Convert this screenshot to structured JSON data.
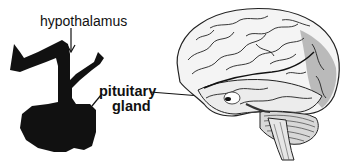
{
  "figure": {
    "labels": {
      "hypothalamus": "hypothalamus",
      "pituitary_line1": "pituitary",
      "pituitary_line2": "gland"
    },
    "colors": {
      "ink": "#111111",
      "background": "#ffffff",
      "brain_shade": "#6a6a6a"
    },
    "panels": [
      {
        "name": "hypothalamus-pituitary-silhouette"
      },
      {
        "name": "brain-lateral-view-illustration"
      }
    ]
  }
}
